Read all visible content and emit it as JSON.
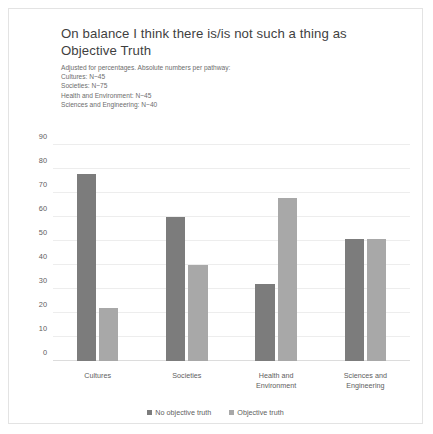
{
  "chart_data": {
    "type": "bar",
    "title": "On balance I think there is/is not such a thing as Objective Truth",
    "subtitle_lines": [
      "Adjusted for percentages. Absolute numbers per pathway:",
      "Cultures: N~45",
      "Societies: N~75",
      "Health and Environment: N~45",
      "Sciences and Engineering: N~40"
    ],
    "categories": [
      "Cultures",
      "Societies",
      "Health and\nEnvironment",
      "Sciences and\nEngineering"
    ],
    "series": [
      {
        "name": "No objective truth",
        "color": "#7c7c7c",
        "values": [
          78,
          60,
          32,
          51
        ]
      },
      {
        "name": "Objective truth",
        "color": "#a8a8a8",
        "values": [
          22,
          40,
          68,
          51
        ]
      }
    ],
    "ylim": [
      0,
      90
    ],
    "yticks": [
      0,
      10,
      20,
      30,
      40,
      50,
      60,
      70,
      80,
      90
    ],
    "ylabel": "",
    "xlabel": "",
    "grid": true,
    "legend_position": "bottom"
  }
}
